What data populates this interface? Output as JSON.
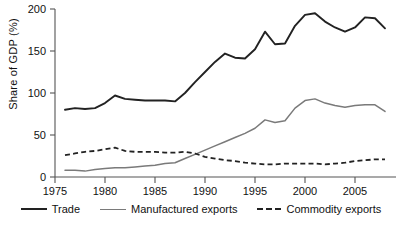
{
  "chart_data": {
    "type": "line",
    "title": "",
    "subtitle": "",
    "xlabel": "",
    "ylabel": "Share of GDP (%)",
    "xlim": [
      1975,
      2008
    ],
    "ylim": [
      0,
      200
    ],
    "grid": false,
    "legend_position": "bottom",
    "x_ticks": [
      1975,
      1980,
      1985,
      1990,
      1995,
      2000,
      2005
    ],
    "y_ticks": [
      0,
      50,
      100,
      150,
      200
    ],
    "x": [
      1976,
      1977,
      1978,
      1979,
      1980,
      1981,
      1982,
      1983,
      1984,
      1985,
      1986,
      1987,
      1988,
      1989,
      1990,
      1991,
      1992,
      1993,
      1994,
      1995,
      1996,
      1997,
      1998,
      1999,
      2000,
      2001,
      2002,
      2003,
      2004,
      2005,
      2006,
      2007,
      2008
    ],
    "series": [
      {
        "name": "Trade",
        "color": "#222222",
        "style": "solid",
        "values": [
          80,
          82,
          81,
          82,
          88,
          97,
          93,
          92,
          91,
          91,
          91,
          90,
          100,
          113,
          125,
          137,
          147,
          142,
          141,
          152,
          173,
          158,
          159,
          180,
          193,
          195,
          185,
          178,
          173,
          178,
          190,
          189,
          177
        ]
      },
      {
        "name": "Manufactured exports",
        "color": "#7a7a7a",
        "style": "solid",
        "values": [
          8,
          8,
          7,
          9,
          10,
          11,
          11,
          12,
          13,
          14,
          16,
          17,
          22,
          27,
          32,
          37,
          42,
          47,
          52,
          58,
          68,
          65,
          67,
          82,
          91,
          93,
          88,
          85,
          83,
          85,
          86,
          86,
          78
        ]
      },
      {
        "name": "Commodity exports",
        "color": "#222222",
        "style": "dashed",
        "values": [
          26,
          28,
          30,
          31,
          33,
          35,
          31,
          30,
          30,
          30,
          29,
          29,
          30,
          28,
          24,
          22,
          20,
          19,
          17,
          16,
          15,
          15,
          16,
          16,
          16,
          16,
          15,
          16,
          17,
          19,
          20,
          21,
          21
        ]
      }
    ]
  },
  "legend": {
    "items": [
      {
        "label": "Trade"
      },
      {
        "label": "Manufactured exports"
      },
      {
        "label": "Commodity exports"
      }
    ]
  }
}
